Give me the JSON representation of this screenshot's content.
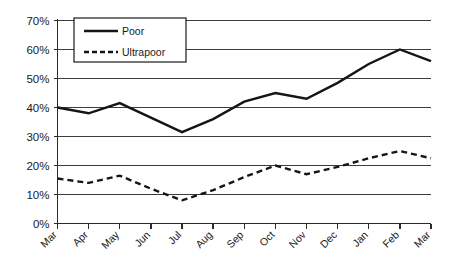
{
  "chart_data": {
    "type": "line",
    "title": "",
    "subtitle": "",
    "xlabel": "",
    "ylabel": "",
    "categories": [
      "Mar",
      "Apr",
      "May",
      "Jun",
      "Jul",
      "Aug",
      "Sep",
      "Oct",
      "Nov",
      "Dec",
      "Jan",
      "Feb",
      "Mar"
    ],
    "ylim": [
      0,
      70
    ],
    "ytick_labels": [
      "70%",
      "60%",
      "50%",
      "40%",
      "30%",
      "20%",
      "10%",
      "0%"
    ],
    "ytick_values": [
      70,
      60,
      50,
      40,
      30,
      20,
      10,
      0
    ],
    "grid": "horizontal",
    "legend_position": "upper-left-inside",
    "value_suffix": "%",
    "series": [
      {
        "name": "Poor",
        "style": "solid",
        "color": "#151515",
        "values": [
          40,
          38,
          41.5,
          36.5,
          31.5,
          36,
          42,
          45,
          43,
          48.5,
          55,
          60,
          56
        ]
      },
      {
        "name": "Ultrapoor",
        "style": "dashed",
        "color": "#151515",
        "values": [
          15.5,
          14,
          16.5,
          12,
          8,
          11.5,
          16,
          20,
          17,
          19.5,
          22.5,
          25,
          22.5
        ]
      }
    ]
  },
  "legend": {
    "items": [
      {
        "label": "Poor",
        "style": "solid"
      },
      {
        "label": "Ultrapoor",
        "style": "dashed"
      }
    ]
  }
}
